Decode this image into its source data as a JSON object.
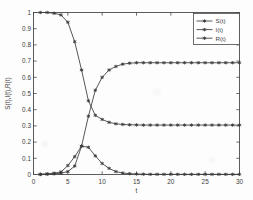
{
  "chart_data": {
    "type": "line",
    "title": "",
    "xlabel": "t",
    "ylabel": "S(t),I(t),R(t)",
    "xlim": [
      0,
      30
    ],
    "ylim": [
      0,
      1
    ],
    "xticks": [
      0,
      5,
      10,
      15,
      20,
      25,
      30
    ],
    "xticklabels": [
      "0",
      "5",
      "10",
      "15",
      "20",
      "25",
      "30"
    ],
    "yticks": [
      0,
      0.1,
      0.2,
      0.3,
      0.4,
      0.5,
      0.6,
      0.7,
      0.8,
      0.9,
      1
    ],
    "yticklabels": [
      "0",
      "0.1",
      "0.2",
      "0.3",
      "0.4",
      "0.5",
      "0.6",
      "0.7",
      "0.8",
      "0.9",
      "1"
    ],
    "grid": false,
    "legend_position": "upper-right",
    "marker": "asterisk",
    "line_color": "#3a3a3a",
    "x": [
      1,
      2,
      3,
      4,
      5,
      6,
      7,
      8,
      9,
      10,
      11,
      12,
      13,
      14,
      15,
      16,
      17,
      18,
      19,
      20,
      21,
      22,
      23,
      24,
      25,
      26,
      27,
      28,
      29,
      30
    ],
    "series": [
      {
        "name": "S(t)",
        "values": [
          1.0,
          1.0,
          0.995,
          0.985,
          0.94,
          0.82,
          0.645,
          0.455,
          0.365,
          0.34,
          0.322,
          0.313,
          0.309,
          0.307,
          0.306,
          0.305,
          0.305,
          0.305,
          0.305,
          0.305,
          0.305,
          0.305,
          0.305,
          0.305,
          0.305,
          0.305,
          0.305,
          0.305,
          0.305,
          0.305
        ]
      },
      {
        "name": "I(t)",
        "values": [
          0.002,
          0.004,
          0.008,
          0.016,
          0.055,
          0.11,
          0.175,
          0.168,
          0.115,
          0.068,
          0.038,
          0.018,
          0.009,
          0.005,
          0.003,
          0.002,
          0.001,
          0.001,
          0.001,
          0.001,
          0.001,
          0.001,
          0.001,
          0.001,
          0.001,
          0.001,
          0.001,
          0.001,
          0.001,
          0.001
        ]
      },
      {
        "name": "R(t)",
        "values": [
          0.0,
          0.002,
          0.004,
          0.008,
          0.018,
          0.052,
          0.175,
          0.36,
          0.52,
          0.6,
          0.645,
          0.667,
          0.681,
          0.687,
          0.69,
          0.69,
          0.69,
          0.69,
          0.69,
          0.69,
          0.69,
          0.69,
          0.69,
          0.69,
          0.69,
          0.69,
          0.69,
          0.69,
          0.69,
          0.69
        ]
      }
    ],
    "legend": [
      "S(t)",
      "I(t)",
      "R(t)"
    ]
  }
}
